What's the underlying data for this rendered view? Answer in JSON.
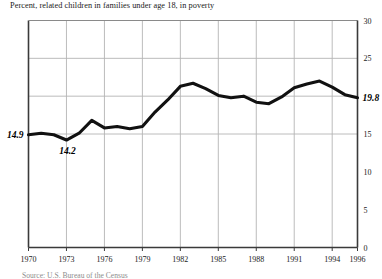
{
  "chart_data": {
    "type": "line",
    "title": "Percent, related children in families under age 18, in poverty",
    "xlabel": "",
    "ylabel": "",
    "xlim": [
      1970,
      1996
    ],
    "ylim": [
      0,
      30
    ],
    "grid": true,
    "legend": false,
    "x_ticks": [
      "1970",
      "1973",
      "1976",
      "1979",
      "1982",
      "1985",
      "1988",
      "1991",
      "1994",
      "1996"
    ],
    "x_tick_values": [
      1970,
      1973,
      1976,
      1979,
      1982,
      1985,
      1988,
      1991,
      1994,
      1996
    ],
    "y_ticks": [
      "0",
      "5",
      "10",
      "15",
      "20",
      "25",
      "30"
    ],
    "y_tick_values": [
      0,
      5,
      10,
      15,
      20,
      25,
      30
    ],
    "y_ticks_drawn": [
      "0",
      "5",
      "10",
      "15",
      "25",
      "30"
    ],
    "gridlines_y": [
      15,
      20,
      25
    ],
    "x": [
      1970,
      1971,
      1972,
      1973,
      1974,
      1975,
      1976,
      1977,
      1978,
      1979,
      1980,
      1981,
      1982,
      1983,
      1984,
      1985,
      1986,
      1987,
      1988,
      1989,
      1990,
      1991,
      1992,
      1993,
      1994,
      1995,
      1996
    ],
    "values": [
      14.9,
      15.1,
      14.9,
      14.2,
      15.1,
      16.8,
      15.8,
      16.0,
      15.7,
      16.0,
      17.9,
      19.5,
      21.3,
      21.7,
      21.0,
      20.1,
      19.8,
      20.0,
      19.2,
      19.0,
      19.9,
      21.1,
      21.6,
      22.0,
      21.2,
      20.2,
      19.8
    ],
    "annotations": [
      {
        "text": "14.9",
        "x": 1970,
        "y": 14.9,
        "position": "left"
      },
      {
        "text": "14.2",
        "x": 1973,
        "y": 14.2,
        "position": "below"
      },
      {
        "text": "19.8",
        "x": 1996,
        "y": 19.8,
        "position": "right"
      }
    ],
    "line_color": "#111111",
    "grid_color": "#b4b4b4",
    "axis_color": "#4d4d4d"
  },
  "source": {
    "note": "Source: U.S. Bureau of the Census"
  }
}
